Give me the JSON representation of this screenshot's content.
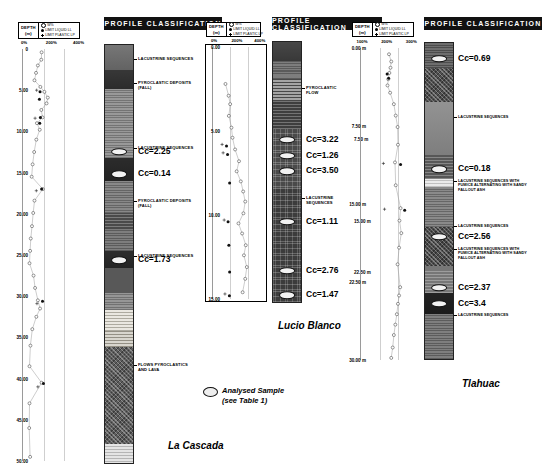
{
  "figure": {
    "sample_legend_line1": "Analysed Sample",
    "sample_legend_line2": "(see Table 1)",
    "profile_header": "PROFILE  CLASSIFICATION"
  },
  "legend": {
    "depth_title": "DEPTH",
    "depth_unit": "(m)",
    "keys": [
      {
        "symbol": "open-circle",
        "label": "W%"
      },
      {
        "symbol": "filled-circle",
        "label": "LIMIT LIQUID  LL"
      },
      {
        "symbol": "plus",
        "label": "LIMIT PLASTIC  LP"
      }
    ]
  },
  "panels": [
    {
      "id": "la-cascada",
      "name": "La Cascada",
      "axis_ticks": [
        "0%",
        "200%",
        "400%"
      ],
      "axis_max": 400,
      "depth_labels": [
        "0",
        "5.00",
        "10.00",
        "15.00",
        "20.00",
        "25.00",
        "30.00",
        "35.00",
        "40.00",
        "45.00",
        "50.00"
      ],
      "depth_min": 0,
      "depth_max": 50,
      "series": [
        {
          "name": "W%",
          "symbol": "open-circle",
          "points": [
            {
              "d": 0.4,
              "v": 120
            },
            {
              "d": 1.3,
              "v": 118
            },
            {
              "d": 2.0,
              "v": 96
            },
            {
              "d": 2.9,
              "v": 84
            },
            {
              "d": 3.8,
              "v": 74
            },
            {
              "d": 4.6,
              "v": 112
            },
            {
              "d": 5.2,
              "v": 138
            },
            {
              "d": 5.9,
              "v": 160
            },
            {
              "d": 6.6,
              "v": 152
            },
            {
              "d": 7.4,
              "v": 118
            },
            {
              "d": 8.3,
              "v": 126
            },
            {
              "d": 9.0,
              "v": 90
            },
            {
              "d": 9.8,
              "v": 108
            },
            {
              "d": 11.0,
              "v": 86
            },
            {
              "d": 12.5,
              "v": 72
            },
            {
              "d": 14.0,
              "v": 62
            },
            {
              "d": 15.5,
              "v": 56
            },
            {
              "d": 17.0,
              "v": 128
            },
            {
              "d": 18.4,
              "v": 74
            },
            {
              "d": 19.9,
              "v": 66
            },
            {
              "d": 21.5,
              "v": 58
            },
            {
              "d": 23.0,
              "v": 50
            },
            {
              "d": 24.5,
              "v": 46
            },
            {
              "d": 26.0,
              "v": 42
            },
            {
              "d": 27.5,
              "v": 68
            },
            {
              "d": 29.0,
              "v": 78
            },
            {
              "d": 30.5,
              "v": 96
            },
            {
              "d": 31.5,
              "v": 110
            },
            {
              "d": 32.5,
              "v": 86
            },
            {
              "d": 34.0,
              "v": 60
            },
            {
              "d": 36.0,
              "v": 48
            },
            {
              "d": 38.5,
              "v": 42
            },
            {
              "d": 40.5,
              "v": 120
            },
            {
              "d": 43.0,
              "v": 42
            },
            {
              "d": 46.0,
              "v": 40
            },
            {
              "d": 49.5,
              "v": 46
            }
          ]
        },
        {
          "name": "LL",
          "symbol": "filled-circle",
          "points": [
            {
              "d": 5.2,
              "v": 110
            },
            {
              "d": 6.1,
              "v": 106
            },
            {
              "d": 8.3,
              "v": 112
            },
            {
              "d": 9.0,
              "v": 108
            },
            {
              "d": 17.0,
              "v": 120
            },
            {
              "d": 30.6,
              "v": 126
            },
            {
              "d": 40.6,
              "v": 132
            }
          ]
        },
        {
          "name": "LP",
          "symbol": "plus",
          "points": [
            {
              "d": 5.0,
              "v": 88
            },
            {
              "d": 8.4,
              "v": 78
            },
            {
              "d": 17.2,
              "v": 86
            },
            {
              "d": 30.9,
              "v": 90
            },
            {
              "d": 41.0,
              "v": 96
            }
          ]
        }
      ],
      "litho_layers": [
        {
          "top": 0,
          "bottom": 3.0,
          "fill": "#6e6e6e",
          "pattern": "massive"
        },
        {
          "top": 3.0,
          "bottom": 5.2,
          "fill": "#3a3a3a",
          "pattern": "dark"
        },
        {
          "top": 5.2,
          "bottom": 13.5,
          "fill": "#8d8d8d",
          "pattern": "mottled"
        },
        {
          "top": 13.5,
          "bottom": 16.2,
          "fill": "#2e2e2e",
          "pattern": "dark"
        },
        {
          "top": 16.2,
          "bottom": 20.0,
          "fill": "#7b7b7b",
          "pattern": "mottled"
        },
        {
          "top": 20.0,
          "bottom": 22.0,
          "fill": "#4a4a4a",
          "pattern": "speckle"
        },
        {
          "top": 22.0,
          "bottom": 24.5,
          "fill": "#6f6f6f",
          "pattern": "mottled"
        },
        {
          "top": 24.5,
          "bottom": 26.5,
          "fill": "#303030",
          "pattern": "dark"
        },
        {
          "top": 26.5,
          "bottom": 29.5,
          "fill": "#585858",
          "pattern": "speckle"
        },
        {
          "top": 29.5,
          "bottom": 31.5,
          "fill": "#8a8a8a",
          "pattern": "mottled"
        },
        {
          "top": 31.5,
          "bottom": 34.0,
          "fill": "#d8d4c8",
          "pattern": "ash"
        },
        {
          "top": 34.0,
          "bottom": 36.0,
          "fill": "#b9b4a6",
          "pattern": "ash"
        },
        {
          "top": 36.0,
          "bottom": 47.5,
          "fill": "#5c5c5c",
          "pattern": "hatch"
        },
        {
          "top": 47.5,
          "bottom": 50.0,
          "fill": "#c9c9c9",
          "pattern": "light"
        }
      ],
      "samples": [
        {
          "d": 12.7,
          "cc": "Cc=2.25"
        },
        {
          "d": 15.4,
          "cc": "Cc=0.14"
        },
        {
          "d": 25.6,
          "cc": "Cc=1.73"
        }
      ],
      "annotations": [
        {
          "d": 1.6,
          "text": "LACUSTRINE SEQUENCES"
        },
        {
          "d": 4.4,
          "text": "PYROCLASTIC DEPOSITS\n(FALL)"
        },
        {
          "d": 12.2,
          "text": "LACUSTRINE SEQUENCES"
        },
        {
          "d": 18.5,
          "text": "PYROCLASTIC DEPOSITS\n(FALL)"
        },
        {
          "d": 25.0,
          "text": "LACUSTRINE SEQUENCES"
        },
        {
          "d": 38.0,
          "text": "FLOWS PYROCLASTICS\nAND LAVA"
        }
      ]
    },
    {
      "id": "lucio-blanco",
      "name": "Lucio Blanco",
      "axis_ticks": [
        "0%",
        "200%",
        "400%"
      ],
      "axis_max": 400,
      "depth_labels": [
        "0.00",
        "5.00",
        "10.00",
        "15.00"
      ],
      "depth_min": 0,
      "depth_max": 15,
      "series": [
        {
          "name": "W%",
          "symbol": "open-circle",
          "points": [
            {
              "d": 2.2,
              "v": 96
            },
            {
              "d": 2.9,
              "v": 120
            },
            {
              "d": 3.4,
              "v": 132
            },
            {
              "d": 4.1,
              "v": 122
            },
            {
              "d": 4.8,
              "v": 142
            },
            {
              "d": 5.4,
              "v": 150
            },
            {
              "d": 6.1,
              "v": 170
            },
            {
              "d": 6.8,
              "v": 200
            },
            {
              "d": 7.4,
              "v": 182
            },
            {
              "d": 8.0,
              "v": 214
            },
            {
              "d": 8.6,
              "v": 232
            },
            {
              "d": 9.2,
              "v": 248
            },
            {
              "d": 9.9,
              "v": 234
            },
            {
              "d": 10.5,
              "v": 196
            },
            {
              "d": 11.1,
              "v": 224
            },
            {
              "d": 11.8,
              "v": 252
            },
            {
              "d": 12.4,
              "v": 238
            },
            {
              "d": 13.1,
              "v": 260
            },
            {
              "d": 13.8,
              "v": 248
            },
            {
              "d": 14.6,
              "v": 228
            }
          ]
        },
        {
          "name": "LL",
          "symbol": "filled-circle",
          "points": [
            {
              "d": 5.9,
              "v": 104
            },
            {
              "d": 6.4,
              "v": 112
            },
            {
              "d": 8.1,
              "v": 128
            },
            {
              "d": 10.4,
              "v": 116
            },
            {
              "d": 11.8,
              "v": 122
            },
            {
              "d": 13.4,
              "v": 128
            },
            {
              "d": 14.8,
              "v": 126
            }
          ]
        },
        {
          "name": "LP",
          "symbol": "plus",
          "points": [
            {
              "d": 5.8,
              "v": 70
            },
            {
              "d": 6.3,
              "v": 78
            },
            {
              "d": 10.3,
              "v": 86
            },
            {
              "d": 14.7,
              "v": 92
            }
          ]
        }
      ],
      "litho_layers": [
        {
          "top": 0,
          "bottom": 1.1,
          "fill": "#4b4b4b",
          "pattern": "dark"
        },
        {
          "top": 1.1,
          "bottom": 2.1,
          "fill": "#6f6f6f",
          "pattern": "mottled"
        },
        {
          "top": 2.1,
          "bottom": 3.4,
          "fill": "#5a5a5a",
          "pattern": "ash"
        },
        {
          "top": 3.4,
          "bottom": 5.0,
          "fill": "#3e3e3e",
          "pattern": "speckle"
        },
        {
          "top": 5.0,
          "bottom": 8.4,
          "fill": "#4a4a4a",
          "pattern": "dots"
        },
        {
          "top": 8.4,
          "bottom": 15.0,
          "fill": "#3c3c3c",
          "pattern": "dots"
        }
      ],
      "samples": [
        {
          "d": 5.6,
          "cc": "Cc=3.22"
        },
        {
          "d": 6.5,
          "cc": "Cc=1.26"
        },
        {
          "d": 7.4,
          "cc": "Cc=3.50"
        },
        {
          "d": 10.3,
          "cc": "Cc=1.11"
        },
        {
          "d": 13.1,
          "cc": "Cc=2.76"
        },
        {
          "d": 14.5,
          "cc": "Cc=1.47"
        }
      ],
      "annotations": [
        {
          "d": 2.6,
          "text": "PYROCLASTIC\nFLOW"
        },
        {
          "d": 8.9,
          "text": "LACUSTRINE\nSEQUENCES"
        }
      ],
      "right_depths": [
        {
          "d": 5.6,
          "text": "7.50 m"
        },
        {
          "d": 10.3,
          "text": "15.00 m"
        },
        {
          "d": 13.2,
          "text": "22.50 m"
        }
      ]
    },
    {
      "id": "tlahuac",
      "name": "Tlahuac",
      "axis_ticks": [
        "100%",
        "200%",
        "300%"
      ],
      "axis_max": 300,
      "depth_labels": [
        "0.00 m",
        "7.50 m",
        "15.00 m",
        "22.50 m",
        "30.00 m"
      ],
      "depth_min": 0,
      "depth_max": 30,
      "series": [
        {
          "name": "W%",
          "symbol": "open-circle",
          "points": [
            {
              "d": 0.6,
              "v": 150
            },
            {
              "d": 1.3,
              "v": 162
            },
            {
              "d": 1.9,
              "v": 158
            },
            {
              "d": 2.4,
              "v": 152
            },
            {
              "d": 3.0,
              "v": 146
            },
            {
              "d": 3.6,
              "v": 142
            },
            {
              "d": 4.3,
              "v": 156
            },
            {
              "d": 5.4,
              "v": 176
            },
            {
              "d": 6.5,
              "v": 186
            },
            {
              "d": 7.6,
              "v": 196
            },
            {
              "d": 9.3,
              "v": 198
            },
            {
              "d": 11.0,
              "v": 182
            },
            {
              "d": 13.2,
              "v": 186
            },
            {
              "d": 15.4,
              "v": 212
            },
            {
              "d": 16.6,
              "v": 206
            },
            {
              "d": 17.8,
              "v": 216
            },
            {
              "d": 19.2,
              "v": 204
            },
            {
              "d": 20.8,
              "v": 196
            },
            {
              "d": 23.0,
              "v": 210
            },
            {
              "d": 23.8,
              "v": 204
            },
            {
              "d": 24.6,
              "v": 198
            },
            {
              "d": 25.6,
              "v": 192
            },
            {
              "d": 26.6,
              "v": 184
            },
            {
              "d": 27.6,
              "v": 176
            },
            {
              "d": 28.8,
              "v": 170
            },
            {
              "d": 29.8,
              "v": 162
            }
          ]
        },
        {
          "name": "LL",
          "symbol": "filled-circle",
          "points": [
            {
              "d": 2.5,
              "v": 140
            },
            {
              "d": 2.9,
              "v": 148
            },
            {
              "d": 11.2,
              "v": 212
            },
            {
              "d": 15.6,
              "v": 234
            }
          ]
        },
        {
          "name": "LP",
          "symbol": "plus",
          "points": [
            {
              "d": 11.1,
              "v": 120
            },
            {
              "d": 15.5,
              "v": 126
            }
          ]
        }
      ],
      "litho_layers": [
        {
          "top": 0,
          "bottom": 2.4,
          "fill": "#5d5d5d",
          "pattern": "mottled"
        },
        {
          "top": 2.4,
          "bottom": 5.6,
          "fill": "#4f4f4f",
          "pattern": "hatch"
        },
        {
          "top": 5.6,
          "bottom": 10.6,
          "fill": "#8c8c8c",
          "pattern": "massive"
        },
        {
          "top": 10.6,
          "bottom": 12.8,
          "fill": "#575757",
          "pattern": "speckle"
        },
        {
          "top": 12.8,
          "bottom": 13.6,
          "fill": "#d6d6d6",
          "pattern": "light"
        },
        {
          "top": 13.6,
          "bottom": 17.4,
          "fill": "#7d7d7d",
          "pattern": "mottled"
        },
        {
          "top": 17.4,
          "bottom": 21.0,
          "fill": "#4a4a4a",
          "pattern": "hatch"
        },
        {
          "top": 21.0,
          "bottom": 23.6,
          "fill": "#777777",
          "pattern": "speckle"
        },
        {
          "top": 23.6,
          "bottom": 25.6,
          "fill": "#242424",
          "pattern": "dark"
        },
        {
          "top": 25.6,
          "bottom": 30.0,
          "fill": "#707070",
          "pattern": "mottled"
        }
      ],
      "samples": [
        {
          "d": 1.5,
          "cc": "Cc=0.69"
        },
        {
          "d": 11.9,
          "cc": "Cc=0.18"
        },
        {
          "d": 18.3,
          "cc": "Cc=2.56"
        },
        {
          "d": 23.1,
          "cc": "Cc=2.37"
        },
        {
          "d": 24.6,
          "cc": "Cc=3.4"
        }
      ],
      "annotations": [
        {
          "d": 6.9,
          "text": "LACUSTRINE SEQUENCES",
          "size": "small"
        },
        {
          "d": 12.9,
          "text": "LACUSTRINE SEQUENCES WITH\nPUMICE ALTERNATING WITH SANDY\nFALLOUT ASH",
          "size": "small"
        },
        {
          "d": 17.2,
          "text": "LACUSTRINE SEQUENCES",
          "size": "small"
        },
        {
          "d": 19.3,
          "text": "LACUSTRINE SEQUENCES WITH\nPUMICE ALTERNATING WITH SANDY\nFALLOUT ASH",
          "size": "small"
        },
        {
          "d": 25.6,
          "text": "LACUSTRINE SEQUENCES",
          "size": "small"
        }
      ]
    }
  ]
}
